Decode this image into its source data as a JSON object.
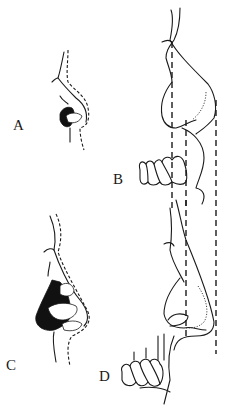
{
  "figure": {
    "panels": [
      {
        "id": "A",
        "label": "A",
        "description": "small nose profile with nostril, skin outline dashed"
      },
      {
        "id": "B",
        "label": "B",
        "description": "profile of nose, upper lip and maxillary teeth with vertical dashed reference lines"
      },
      {
        "id": "C",
        "label": "C",
        "description": "larger nose profile with nostril, skin outline dashed"
      },
      {
        "id": "D",
        "label": "D",
        "description": "profile of nose, upper lip and maxillary teeth with vertical dashed reference lines"
      }
    ]
  }
}
